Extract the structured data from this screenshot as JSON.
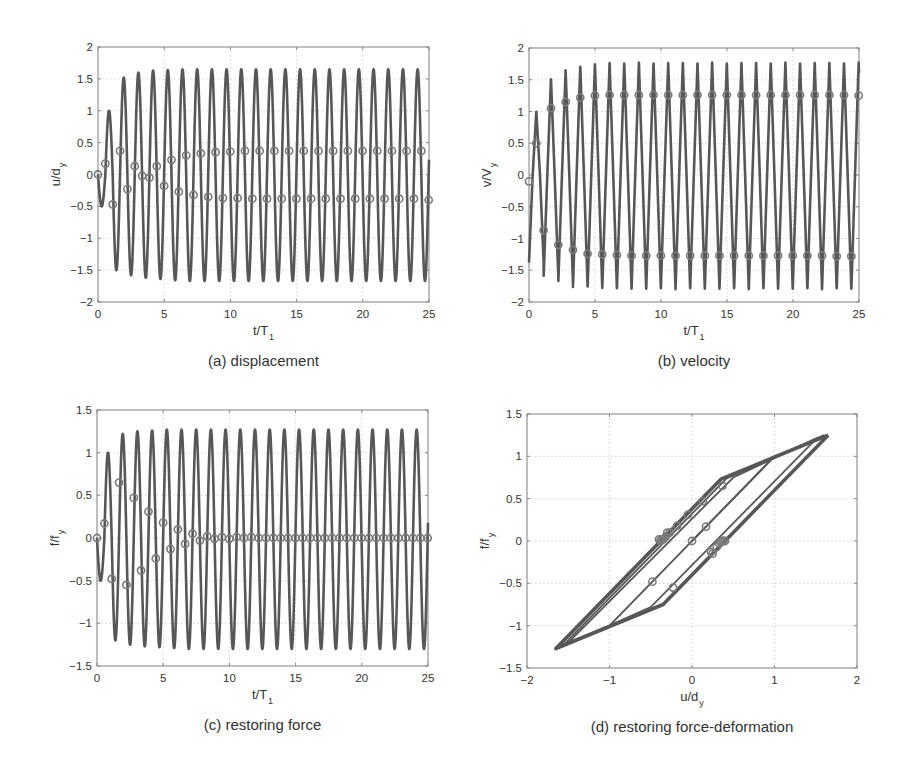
{
  "colors": {
    "line": "#575757",
    "marker": "#7a7a7a",
    "frame": "#8a8a8a",
    "grid": "#c8c8c8",
    "text": "#333333"
  },
  "chart_data": [
    {
      "id": "a",
      "type": "line",
      "caption": "(a) displacement",
      "xlabel": "t/T",
      "xlabel_sub": "1",
      "ylabel": "u/d",
      "ylabel_sub": "y",
      "xlim": [
        0,
        25
      ],
      "ylim": [
        -2,
        2
      ],
      "xticks": [
        0,
        5,
        10,
        15,
        20,
        25
      ],
      "yticks": [
        -2,
        -1.5,
        -1,
        -0.5,
        0,
        0.5,
        1,
        1.5,
        2
      ],
      "ytick_labels": [
        "-2",
        "-1.5",
        "-1",
        "-0.5",
        "0",
        "0.5",
        "1",
        "1.5",
        "2"
      ],
      "grid": true,
      "frame": {
        "left": 98,
        "top": 47,
        "right": 429,
        "bottom": 302
      },
      "signal": {
        "period": 1.11,
        "peaks": [
          1.0,
          1.52,
          1.6,
          1.63,
          1.64,
          1.65
        ],
        "troughs": [
          -0.5,
          -1.5,
          -1.58,
          -1.62,
          -1.64,
          -1.66
        ],
        "steady_peak": 1.65,
        "steady_trough": -1.67,
        "shape": "sine"
      },
      "markers": {
        "interval": 0.555,
        "values": [
          0,
          0.17,
          -0.47,
          0.37,
          -0.23,
          0.13,
          -0.02,
          -0.05,
          0.13,
          -0.18,
          0.23,
          -0.27,
          0.3,
          -0.32,
          0.33,
          -0.35,
          0.35,
          -0.37,
          0.36,
          -0.37,
          0.37,
          -0.38,
          0.37,
          -0.38,
          0.37,
          -0.38,
          0.37,
          -0.38,
          0.37,
          -0.38,
          0.37,
          -0.38,
          0.37,
          -0.38,
          0.37,
          -0.38,
          0.37,
          -0.38,
          0.37,
          -0.38,
          0.37,
          -0.38,
          0.37,
          -0.38,
          0.37,
          -0.4
        ]
      }
    },
    {
      "id": "b",
      "type": "line",
      "caption": "(b) velocity",
      "xlabel": "t/T",
      "xlabel_sub": "1",
      "ylabel": "v/V",
      "ylabel_sub": "y",
      "xlim": [
        0,
        25
      ],
      "ylim": [
        -2,
        2
      ],
      "xticks": [
        0,
        5,
        10,
        15,
        20,
        25
      ],
      "yticks": [
        -2,
        -1.5,
        -1,
        -0.5,
        0,
        0.5,
        1,
        1.5,
        2
      ],
      "ytick_labels": [
        "-2",
        "-1.5",
        "-1",
        "-0.5",
        "0",
        "0.5",
        "1",
        "1.5",
        "2"
      ],
      "grid": true,
      "frame": {
        "left": 529,
        "top": 48,
        "right": 859,
        "bottom": 302
      },
      "signal": {
        "period": 1.11,
        "peaks": [
          1.0,
          1.52,
          1.65,
          1.72,
          1.75,
          1.77
        ],
        "troughs": [
          -1.38,
          -1.6,
          -1.7,
          -1.77,
          -1.78,
          -1.8
        ],
        "steady_peak": 1.77,
        "steady_trough": -1.8,
        "shape": "spike"
      },
      "markers": {
        "interval": 0.555,
        "values": [
          -0.1,
          0.5,
          -0.87,
          1.05,
          -1.1,
          1.15,
          -1.18,
          1.22,
          -1.24,
          1.25,
          -1.25,
          1.26,
          -1.26,
          1.26,
          -1.27,
          1.26,
          -1.27,
          1.26,
          -1.27,
          1.26,
          -1.27,
          1.26,
          -1.27,
          1.26,
          -1.27,
          1.26,
          -1.27,
          1.26,
          -1.27,
          1.26,
          -1.27,
          1.26,
          -1.27,
          1.26,
          -1.27,
          1.26,
          -1.27,
          1.26,
          -1.27,
          1.26,
          -1.27,
          1.26,
          -1.28,
          1.26,
          -1.28,
          1.25
        ]
      }
    },
    {
      "id": "c",
      "type": "line",
      "caption": "(c) restoring force",
      "xlabel": "t/T",
      "xlabel_sub": "1",
      "ylabel": "f/f",
      "ylabel_sub": "y",
      "xlim": [
        0,
        25
      ],
      "ylim": [
        -1.5,
        1.5
      ],
      "xticks": [
        0,
        5,
        10,
        15,
        20,
        25
      ],
      "yticks": [
        -1.5,
        -1,
        -0.5,
        0,
        0.5,
        1,
        1.5
      ],
      "ytick_labels": [
        "-1.5",
        "-1",
        "-0.5",
        "0",
        "0.5",
        "1",
        "1.5"
      ],
      "grid": true,
      "frame": {
        "left": 97,
        "top": 410,
        "right": 428,
        "bottom": 666
      },
      "signal": {
        "period": 1.11,
        "peaks": [
          1.0,
          1.22,
          1.25,
          1.26,
          1.27,
          1.27
        ],
        "troughs": [
          -0.5,
          -1.2,
          -1.25,
          -1.27,
          -1.28,
          -1.29
        ],
        "steady_peak": 1.27,
        "steady_trough": -1.3,
        "shape": "sine"
      },
      "markers": {
        "interval": 0.555,
        "values": [
          0,
          0.17,
          -0.48,
          0.65,
          -0.55,
          0.47,
          -0.38,
          0.31,
          -0.24,
          0.18,
          -0.13,
          0.1,
          -0.07,
          0.05,
          -0.03,
          0.02,
          -0.01,
          0.01,
          -0.01,
          0.01,
          0,
          0.01,
          0,
          0,
          0,
          0,
          0,
          0,
          0,
          0,
          0,
          0,
          0,
          0,
          0,
          0,
          0,
          0,
          0,
          0,
          0,
          0,
          0,
          0,
          0,
          0
        ]
      }
    },
    {
      "id": "d",
      "type": "line",
      "caption": "(d) restoring force-deformation",
      "xlabel": "u/d",
      "xlabel_sub": "y",
      "ylabel": "f/f",
      "ylabel_sub": "y",
      "xlim": [
        -2,
        2
      ],
      "ylim": [
        -1.5,
        1.5
      ],
      "xticks": [
        -2,
        -1,
        0,
        1,
        2
      ],
      "xtick_labels": [
        "-2",
        "-1",
        "0",
        "1",
        "2"
      ],
      "yticks": [
        -1.5,
        -1,
        -0.5,
        0,
        0.5,
        1,
        1.5
      ],
      "ytick_labels": [
        "-1.5",
        "-1",
        "-0.5",
        "0",
        "0.5",
        "1",
        "1.5"
      ],
      "grid": true,
      "frame": {
        "left": 527,
        "top": 414,
        "right": 857,
        "bottom": 668
      },
      "hysteresis": {
        "initial_path": [
          [
            0,
            0
          ],
          [
            1.0,
            1.0
          ],
          [
            1.65,
            1.25
          ]
        ],
        "steady_loop": [
          [
            1.65,
            1.25
          ],
          [
            -0.35,
            -0.75
          ],
          [
            -1.65,
            -1.27
          ],
          [
            0.35,
            0.73
          ],
          [
            1.65,
            1.25
          ]
        ],
        "transient_loops": [
          [
            [
              1.0,
              1.0
            ],
            [
              -1.0,
              -1.0
            ],
            [
              -1.5,
              -1.2
            ],
            [
              0.5,
              0.75
            ],
            [
              1.52,
              1.22
            ]
          ],
          [
            [
              1.52,
              1.22
            ],
            [
              -0.5,
              -0.78
            ],
            [
              -1.58,
              -1.25
            ],
            [
              0.42,
              0.74
            ],
            [
              1.6,
              1.25
            ]
          ]
        ],
        "markers": [
          [
            0,
            0
          ],
          [
            0.17,
            0.17
          ],
          [
            -0.48,
            -0.48
          ],
          [
            0.37,
            0.65
          ],
          [
            -0.23,
            -0.55
          ],
          [
            0.13,
            0.47
          ],
          [
            -0.05,
            0.31
          ],
          [
            -0.18,
            0.18
          ],
          [
            0.23,
            -0.13
          ],
          [
            -0.27,
            0.1
          ],
          [
            0.3,
            -0.07
          ],
          [
            -0.32,
            0.05
          ],
          [
            0.33,
            -0.03
          ],
          [
            -0.35,
            0.02
          ],
          [
            0.35,
            -0.01
          ],
          [
            -0.37,
            0.01
          ],
          [
            0.37,
            0
          ],
          [
            -0.38,
            0
          ],
          [
            0.38,
            0
          ],
          [
            -0.38,
            0.01
          ],
          [
            0.25,
            -0.15
          ],
          [
            -0.3,
            0.1
          ],
          [
            0.4,
            0
          ],
          [
            -0.4,
            0.02
          ]
        ]
      }
    }
  ]
}
